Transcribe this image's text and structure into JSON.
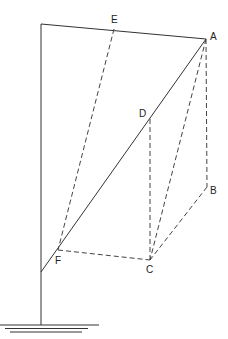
{
  "diagram": {
    "points": {
      "A": {
        "label": "A",
        "x": 206,
        "y": 39
      },
      "B": {
        "label": "B",
        "x": 207,
        "y": 187
      },
      "C": {
        "label": "C",
        "x": 150,
        "y": 260
      },
      "D": {
        "label": "D",
        "x": 150,
        "y": 119
      },
      "E": {
        "label": "E",
        "x": 114,
        "y": 29
      },
      "F": {
        "label": "F",
        "x": 58,
        "y": 250
      }
    },
    "labels": {
      "A": "A",
      "B": "B",
      "C": "C",
      "D": "D",
      "E": "E",
      "F": "F"
    },
    "solid_lines": [
      [
        "pole_top",
        "pole_bottom"
      ],
      [
        "pole_top",
        "A"
      ],
      [
        "A",
        "pole_junction"
      ]
    ],
    "dashed_lines": [
      [
        "E",
        "F"
      ],
      [
        "A",
        "B"
      ],
      [
        "A",
        "C"
      ],
      [
        "D",
        "C"
      ],
      [
        "B",
        "C"
      ],
      [
        "F",
        "C"
      ]
    ],
    "ground": "ground-hatch"
  }
}
